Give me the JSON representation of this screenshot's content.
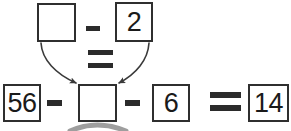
{
  "diagram": {
    "type": "equation-diagram",
    "colors": {
      "stroke": "#2f2f2f",
      "glyph": "#2b2b2b",
      "arrow": "#3a3a3a",
      "shadow_arc": "#8d8d8d",
      "background": "#ffffff"
    },
    "top_row": {
      "box_empty_value": "",
      "operator_minus": "−",
      "box_two_value": "2"
    },
    "middle": {
      "operator_equals": "="
    },
    "bottom_row": {
      "box_56_value": "56",
      "operator_minus_1": "−",
      "box_empty_value": "",
      "operator_minus_2": "−",
      "box_6_value": "6",
      "operator_equals": "=",
      "box_14_value": "14"
    },
    "arrows": [
      {
        "name": "arrow-left-down",
        "from": "top-empty-box",
        "to": "middle-empty-box-left"
      },
      {
        "name": "arrow-right-down",
        "from": "two-box",
        "to": "middle-empty-box-right"
      }
    ],
    "decoration": {
      "name": "shadow-arc",
      "description": "gray curved arc clipped at bottom edge below middle box"
    }
  }
}
